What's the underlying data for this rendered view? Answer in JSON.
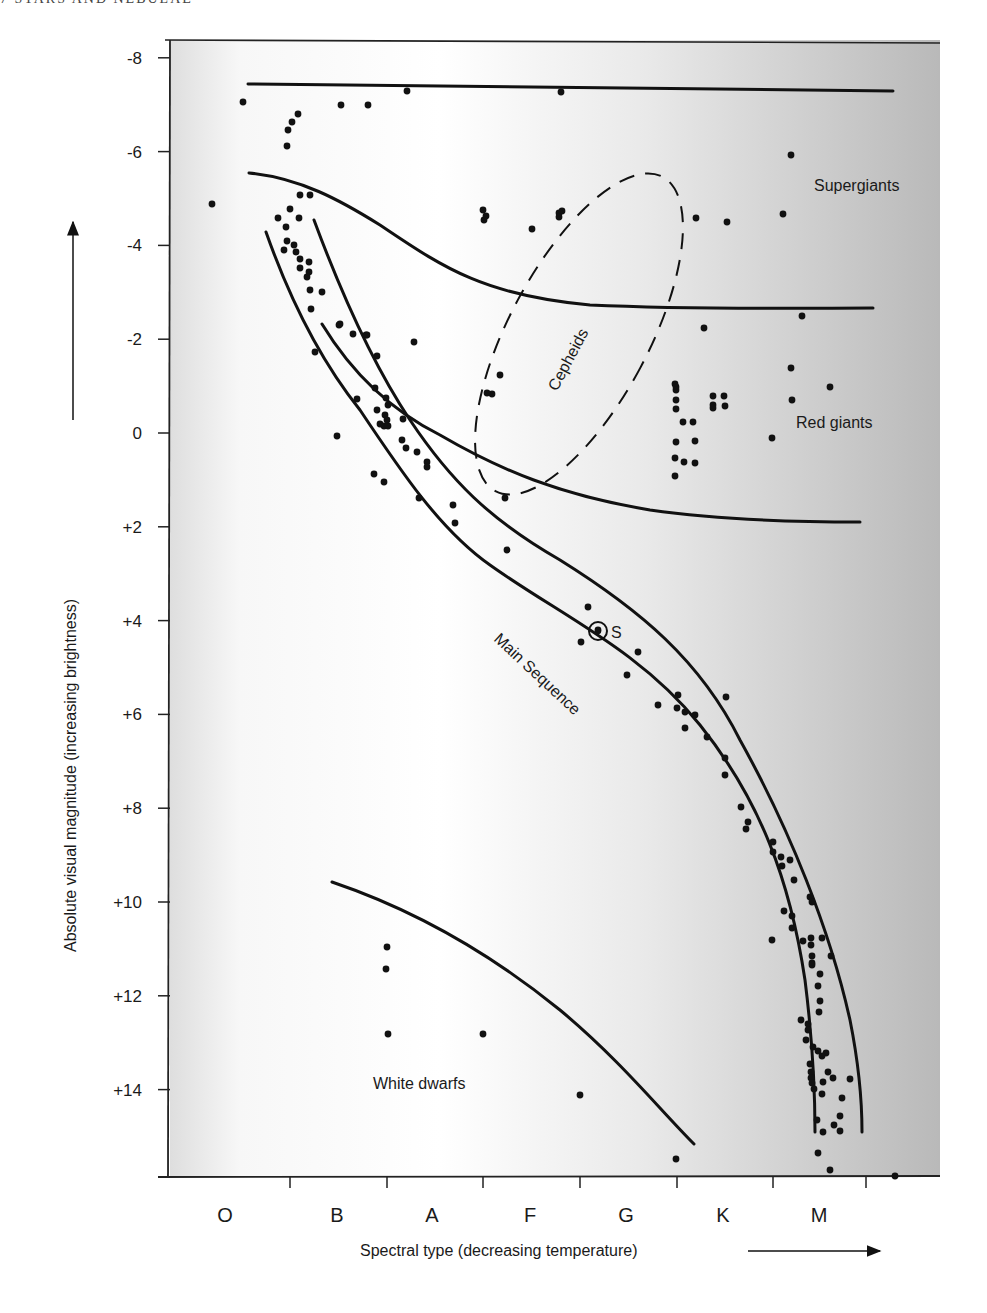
{
  "page_header": "7 STARS AND NEBULAE",
  "chart_data": {
    "type": "scatter",
    "title": "",
    "xlabel": "Spectral type (decreasing temperature)",
    "ylabel": "Absolute visual magnitude (increasing brightness)",
    "x_categories": [
      "O",
      "B",
      "A",
      "F",
      "G",
      "K",
      "M"
    ],
    "y_ticks": [
      "-8",
      "-6",
      "-4",
      "-2",
      "0",
      "+2",
      "+4",
      "+6",
      "+8",
      "+10",
      "+12",
      "+14"
    ],
    "y_tick_values": [
      -8,
      -6,
      -4,
      -2,
      0,
      2,
      4,
      6,
      8,
      10,
      12,
      14
    ],
    "ylim": [
      16,
      -8
    ],
    "y_inverted": true,
    "grid": false,
    "legend": null,
    "region_labels": [
      {
        "name": "Supergiants",
        "x_type": "M",
        "magnitude": -5.3
      },
      {
        "name": "Red giants",
        "x_type": "M",
        "magnitude": 0.2
      },
      {
        "name": "Cepheids",
        "x_type": "F-G",
        "magnitude": -1.2
      },
      {
        "name": "Main Sequence",
        "x_type": "G",
        "magnitude": 5
      },
      {
        "name": "White dwarfs",
        "x_type": "A-F",
        "magnitude": 14.3
      }
    ],
    "annotations": [
      {
        "label": "S",
        "meaning": "Sun",
        "x_type": "G2",
        "magnitude": 4.3
      }
    ],
    "points_px": [
      [
        212,
        204
      ],
      [
        243,
        102
      ],
      [
        287,
        146
      ],
      [
        288,
        130
      ],
      [
        292,
        122
      ],
      [
        298,
        114
      ],
      [
        341,
        105
      ],
      [
        368,
        105
      ],
      [
        407,
        91
      ],
      [
        561,
        92
      ],
      [
        300,
        195
      ],
      [
        310,
        195
      ],
      [
        290,
        209
      ],
      [
        278,
        218
      ],
      [
        299,
        218
      ],
      [
        286,
        227
      ],
      [
        287,
        241
      ],
      [
        294,
        245
      ],
      [
        284,
        250
      ],
      [
        296,
        252
      ],
      [
        300,
        259
      ],
      [
        309,
        262
      ],
      [
        300,
        268
      ],
      [
        309,
        272
      ],
      [
        307,
        277
      ],
      [
        310,
        290
      ],
      [
        322,
        292
      ],
      [
        311,
        309
      ],
      [
        339,
        325
      ],
      [
        315,
        352
      ],
      [
        340,
        324
      ],
      [
        353,
        334
      ],
      [
        366,
        335
      ],
      [
        367,
        335
      ],
      [
        377,
        356
      ],
      [
        414,
        342
      ],
      [
        357,
        399
      ],
      [
        375,
        388
      ],
      [
        377,
        410
      ],
      [
        380,
        424
      ],
      [
        384,
        426
      ],
      [
        388,
        426
      ],
      [
        385,
        415
      ],
      [
        388,
        405
      ],
      [
        386,
        398
      ],
      [
        387,
        420
      ],
      [
        403,
        419
      ],
      [
        337,
        436
      ],
      [
        402,
        440
      ],
      [
        406,
        448
      ],
      [
        417,
        452
      ],
      [
        427,
        462
      ],
      [
        427,
        467
      ],
      [
        374,
        474
      ],
      [
        384,
        482
      ],
      [
        419,
        498
      ],
      [
        453,
        505
      ],
      [
        505,
        498
      ],
      [
        455,
        523
      ],
      [
        507,
        550
      ],
      [
        483,
        210
      ],
      [
        484,
        220
      ],
      [
        486,
        216
      ],
      [
        532,
        229
      ],
      [
        559,
        213
      ],
      [
        562,
        211
      ],
      [
        559,
        217
      ],
      [
        696,
        218
      ],
      [
        727,
        222
      ],
      [
        783,
        214
      ],
      [
        791,
        155
      ],
      [
        802,
        316
      ],
      [
        704,
        328
      ],
      [
        492,
        394
      ],
      [
        487,
        393
      ],
      [
        500,
        375
      ],
      [
        675,
        384
      ],
      [
        676,
        387
      ],
      [
        676,
        390
      ],
      [
        676,
        400
      ],
      [
        676,
        409
      ],
      [
        683,
        422
      ],
      [
        693,
        422
      ],
      [
        676,
        442
      ],
      [
        695,
        441
      ],
      [
        675,
        458
      ],
      [
        684,
        462
      ],
      [
        695,
        463
      ],
      [
        675,
        476
      ],
      [
        713,
        396
      ],
      [
        713,
        405
      ],
      [
        713,
        408
      ],
      [
        724,
        396
      ],
      [
        725,
        406
      ],
      [
        791,
        368
      ],
      [
        792,
        400
      ],
      [
        830,
        387
      ],
      [
        772,
        438
      ],
      [
        588,
        607
      ],
      [
        598,
        630
      ],
      [
        581,
        642
      ],
      [
        638,
        652
      ],
      [
        627,
        675
      ],
      [
        658,
        705
      ],
      [
        678,
        695
      ],
      [
        677,
        708
      ],
      [
        685,
        712
      ],
      [
        695,
        715
      ],
      [
        685,
        728
      ],
      [
        707,
        737
      ],
      [
        726,
        697
      ],
      [
        725,
        758
      ],
      [
        725,
        775
      ],
      [
        741,
        807
      ],
      [
        748,
        822
      ],
      [
        746,
        829
      ],
      [
        773,
        842
      ],
      [
        773,
        852
      ],
      [
        781,
        857
      ],
      [
        782,
        866
      ],
      [
        790,
        860
      ],
      [
        794,
        880
      ],
      [
        810,
        897
      ],
      [
        812,
        902
      ],
      [
        784,
        911
      ],
      [
        792,
        916
      ],
      [
        792,
        928
      ],
      [
        811,
        938
      ],
      [
        811,
        945
      ],
      [
        772,
        940
      ],
      [
        803,
        941
      ],
      [
        812,
        956
      ],
      [
        812,
        963
      ],
      [
        822,
        938
      ],
      [
        831,
        956
      ],
      [
        812,
        965
      ],
      [
        820,
        974
      ],
      [
        818,
        986
      ],
      [
        820,
        1001
      ],
      [
        819,
        1012
      ],
      [
        801,
        1020
      ],
      [
        808,
        1024
      ],
      [
        808,
        1030
      ],
      [
        806,
        1040
      ],
      [
        813,
        1047
      ],
      [
        818,
        1051
      ],
      [
        826,
        1053
      ],
      [
        810,
        1064
      ],
      [
        822,
        1056
      ],
      [
        828,
        1072
      ],
      [
        823,
        1082
      ],
      [
        811,
        1072
      ],
      [
        811,
        1078
      ],
      [
        812,
        1083
      ],
      [
        850,
        1079
      ],
      [
        833,
        1078
      ],
      [
        814,
        1089
      ],
      [
        822,
        1094
      ],
      [
        842,
        1098
      ],
      [
        817,
        1120
      ],
      [
        823,
        1132
      ],
      [
        834,
        1125
      ],
      [
        840,
        1116
      ],
      [
        840,
        1131
      ],
      [
        818,
        1153
      ],
      [
        830,
        1170
      ],
      [
        895,
        1176
      ],
      [
        387,
        947
      ],
      [
        386,
        969
      ],
      [
        388,
        1034
      ],
      [
        483,
        1034
      ],
      [
        580,
        1095
      ],
      [
        676,
        1159
      ]
    ],
    "sun_px": [
      598,
      631
    ]
  },
  "labels": {
    "supergiants": "Supergiants",
    "red_giants": "Red giants",
    "cepheids": "Cepheids",
    "main_sequence": "Main Sequence",
    "white_dwarfs": "White dwarfs",
    "sun": "S"
  },
  "colors": {
    "ink": "#111111",
    "panel_light": "#ffffff",
    "panel_dark": "#bdbdbd"
  }
}
